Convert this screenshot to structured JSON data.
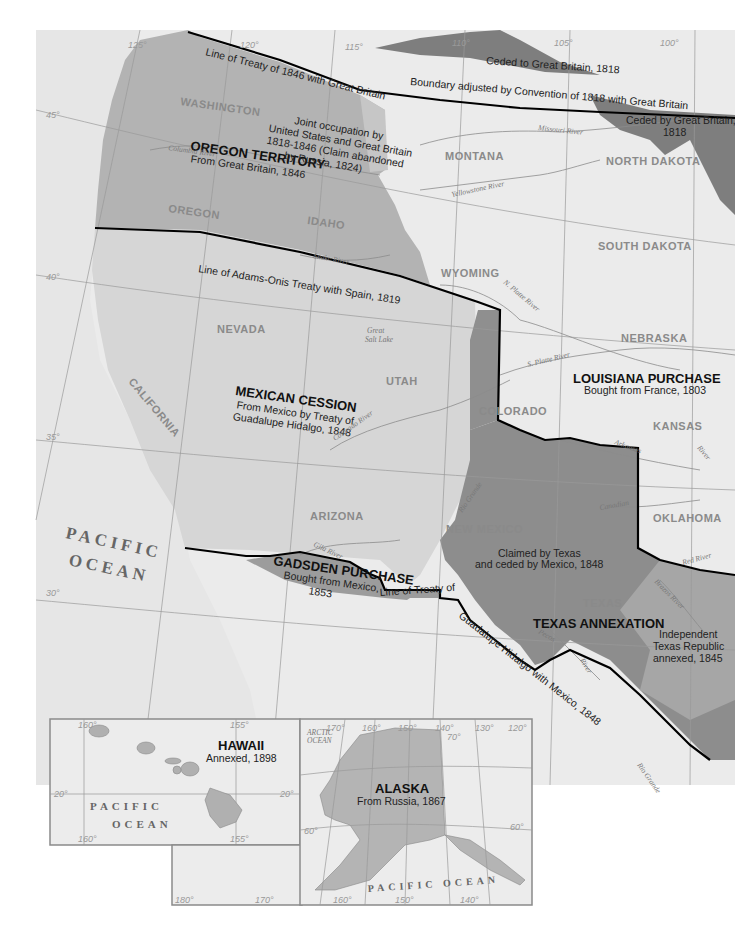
{
  "map": {
    "regions": {
      "oregon": {
        "title": "OREGON TERRITORY",
        "sub": "From Great Britain, 1846"
      },
      "joint": {
        "lines": [
          "Joint occupation by",
          "United States and Great Britain",
          "1818-1846 (Claim abandoned",
          "by Russia, 1824)"
        ]
      },
      "louisiana": {
        "title": "LOUISIANA PURCHASE",
        "sub": "Bought from France, 1803"
      },
      "mexican": {
        "title": "MEXICAN CESSION",
        "sub1": "From Mexico by Treaty of",
        "sub2": "Guadalupe Hidalgo, 1848"
      },
      "gadsden": {
        "title": "GADSDEN PURCHASE",
        "sub1": "Bought from Mexico,",
        "sub2": "1853"
      },
      "texas": {
        "title": "TEXAS ANNEXATION"
      },
      "claimed": {
        "line1": "Claimed by Texas",
        "line2": "and ceded by Mexico, 1848"
      },
      "republic": {
        "line1": "Independent",
        "line2": "Texas Republic",
        "line3": "annexed, 1845"
      },
      "ceded_to": "Ceded to Great Britain, 1818",
      "ceded_by1": "Ceded by Great Britain,",
      "ceded_by2": "1818"
    },
    "treaty_lines": {
      "t1846": "Line of Treaty of 1846 with Great Britain",
      "t1818": "Boundary adjusted by Convention of 1818 with Great Britain",
      "adams_onis": "Line of Adams-Onis Treaty with Spain, 1819",
      "guadalupe1": "Line of Treaty of",
      "guadalupe2": "Guadalupe Hidalgo with Mexico, 1848"
    },
    "states": [
      "WASHINGTON",
      "OREGON",
      "IDAHO",
      "MONTANA",
      "NORTH DAKOTA",
      "SOUTH DAKOTA",
      "WYOMING",
      "NEBRASKA",
      "NEVADA",
      "UTAH",
      "CALIFORNIA",
      "COLORADO",
      "KANSAS",
      "ARIZONA",
      "NEW MEXICO",
      "OKLAHOMA",
      "TEXAS"
    ],
    "rivers": {
      "columbia": "Columbia River",
      "missouri": "Missouri River",
      "yellowstone": "Yellowstone River",
      "snake": "Snake River",
      "n_platte": "N. Platte River",
      "s_platte": "S. Platte River",
      "great_salt_lake1": "Great",
      "great_salt_lake2": "Salt Lake",
      "colorado": "Colorado River",
      "arkansas": "Arkansas",
      "arkansas_river": "River",
      "rio_grande": "Rio Grande",
      "canadian": "Canadian",
      "gila": "Gila River",
      "red": "Red River",
      "brazos": "Brazos River",
      "pecos": "Pecos",
      "pecos_river": "River",
      "rio_grande_s": "Rio Grande"
    },
    "ocean": {
      "line1": "PACIFIC",
      "line2": "OCEAN"
    },
    "grid_labels": {
      "lon": [
        "125°",
        "120°",
        "115°",
        "110°",
        "105°",
        "100°"
      ],
      "lat": [
        "45°",
        "40°",
        "35°",
        "30°"
      ]
    },
    "insets": {
      "hawaii": {
        "title": "HAWAII",
        "sub": "Annexed, 1898",
        "ocean1": "PACIFIC",
        "ocean2": "OCEAN",
        "grid": [
          "160°",
          "155°",
          "20°",
          "20°",
          "160°",
          "155°"
        ]
      },
      "alaska": {
        "title": "ALASKA",
        "sub": "From Russia, 1867",
        "arctic1": "ARCTIC",
        "arctic2": "OCEAN",
        "ocean": "PACIFIC OCEAN",
        "grid_top": [
          "170°",
          "160°",
          "150°",
          "140°",
          "130°",
          "120°"
        ],
        "grid_bottom": [
          "180°",
          "170°",
          "160°",
          "150°",
          "140°"
        ],
        "lat": [
          "70°",
          "60°",
          "60°"
        ]
      }
    },
    "colors": {
      "background": "#ffffff",
      "land": "#e9e9e9",
      "oregon": "#b3b3b3",
      "mexican": "#d4d4d4",
      "texas": "#8d8d8d",
      "republic": "#a6a6a6",
      "gadsden": "#9c9c9c",
      "ceded": "#7e7e7e",
      "border": "#000000"
    }
  }
}
